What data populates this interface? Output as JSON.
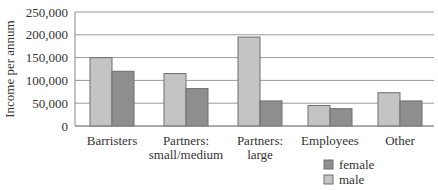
{
  "chart_data": {
    "type": "bar",
    "title": "",
    "xlabel": "",
    "ylabel": "Income per annum",
    "ylim": [
      0,
      250000
    ],
    "yticks": [
      0,
      50000,
      100000,
      150000,
      200000,
      250000
    ],
    "ytick_labels": [
      "0",
      "50,000",
      "100,000",
      "150,000",
      "200,000",
      "250,000"
    ],
    "grid": true,
    "legend_position": "bottom-right",
    "categories": [
      [
        "Barristers"
      ],
      [
        "Partners:",
        "small/medium"
      ],
      [
        "Partners:",
        "large"
      ],
      [
        "Employees"
      ],
      [
        "Other"
      ]
    ],
    "series": [
      {
        "name": "male",
        "color": "#c4c4c4",
        "values": [
          150000,
          115000,
          195000,
          45000,
          73000
        ]
      },
      {
        "name": "female",
        "color": "#8e8e8e",
        "values": [
          120000,
          82000,
          55000,
          38000,
          55000
        ]
      }
    ],
    "legend": [
      {
        "label": "female",
        "color": "#8e8e8e"
      },
      {
        "label": "male",
        "color": "#c4c4c4"
      }
    ]
  }
}
